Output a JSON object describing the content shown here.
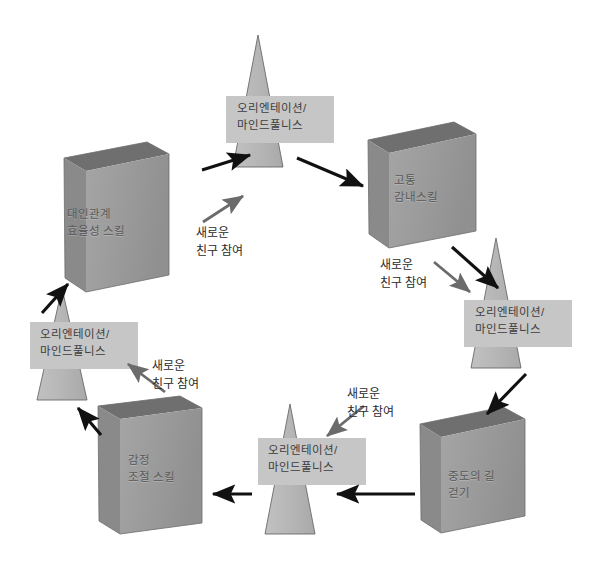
{
  "diagram": {
    "type": "cycle-diagram",
    "colors": {
      "background": "#ffffff",
      "box_front": "#9b9b9b",
      "box_side": "#8a8a8a",
      "box_top": "#6f6f6f",
      "pyramid_fill": "#b7b7b7",
      "pyramid_band": "#c6c6c6",
      "arrow_black": "#111111",
      "arrow_gray": "#6b6b6b",
      "box_text": "#595959",
      "pyramid_text": "#3d3d3d",
      "label_text": "#2b2b2b"
    },
    "nodes": [
      {
        "id": "pyramid-top",
        "shape": "pyramid",
        "lines": [
          "오리엔테이션/",
          "마인드풀니스"
        ]
      },
      {
        "id": "box-distress-tolerance",
        "shape": "box",
        "lines": [
          "고통",
          "감내스킬"
        ]
      },
      {
        "id": "pyramid-right",
        "shape": "pyramid",
        "lines": [
          "오리엔테이션/",
          "마인드풀니스"
        ]
      },
      {
        "id": "box-middle-path",
        "shape": "box",
        "lines": [
          "중도의 길",
          "걷기"
        ]
      },
      {
        "id": "pyramid-bottom",
        "shape": "pyramid",
        "lines": [
          "오리엔테이션/",
          "마인드풀니스"
        ]
      },
      {
        "id": "box-emotion-regulation",
        "shape": "box",
        "lines": [
          "감정",
          "조절 스킬"
        ]
      },
      {
        "id": "pyramid-left",
        "shape": "pyramid",
        "lines": [
          "오리엔테이션/",
          "마인드풀니스"
        ]
      },
      {
        "id": "box-interpersonal",
        "shape": "box",
        "lines": [
          "대인관계",
          "효율성 스킬"
        ]
      }
    ],
    "edge_labels": [
      {
        "id": "join-top",
        "lines": [
          "새로운",
          "친구 참여"
        ]
      },
      {
        "id": "join-right",
        "lines": [
          "새로운",
          "친구 참여"
        ]
      },
      {
        "id": "join-bottom",
        "lines": [
          "새로운",
          "친구 참여"
        ]
      },
      {
        "id": "join-left",
        "lines": [
          "새로운",
          "친구 참여"
        ]
      }
    ]
  }
}
